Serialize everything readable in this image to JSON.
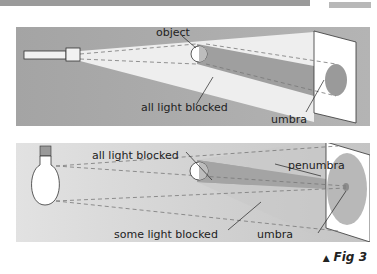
{
  "figure": {
    "caption_marker": "▲",
    "caption": "Fig 3",
    "panels": [
      {
        "name": "flashlight-panel",
        "labels": {
          "object": "object",
          "all_light_blocked": "all light blocked",
          "umbra": "umbra"
        },
        "background": "#a9a9a9",
        "beam_color": "#f2f2f2",
        "shadow_color": "#9c9c9c"
      },
      {
        "name": "bulb-panel",
        "labels": {
          "all_light_blocked": "all light blocked",
          "penumbra": "penumbra",
          "some_light_blocked": "some light blocked",
          "umbra": "umbra"
        },
        "background": "#d8d8d8",
        "shadow_color": "#a5a5a5"
      }
    ]
  }
}
